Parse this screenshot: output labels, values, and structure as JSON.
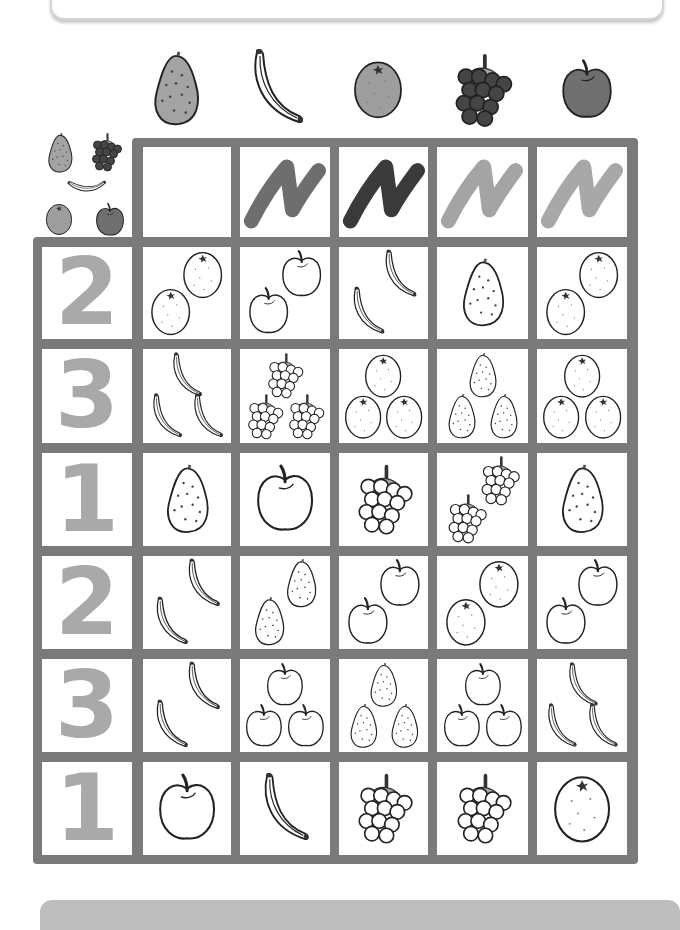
{
  "worksheet": {
    "header_fruits": [
      "pear",
      "banana",
      "orange",
      "grapes",
      "apple"
    ],
    "legend_fruits": [
      "pear",
      "grapes",
      "banana",
      "orange",
      "apple"
    ],
    "color_swatches": [
      {
        "label": "scribble",
        "color": "#6e6e6e"
      },
      {
        "label": "scribble",
        "color": "#3a3a3a"
      },
      {
        "label": "scribble",
        "color": "#a4a4a4"
      },
      {
        "label": "scribble",
        "color": "#a8a8a8"
      }
    ],
    "rows": [
      {
        "number": "2",
        "cells": [
          {
            "fruit": "orange",
            "count": 2
          },
          {
            "fruit": "apple",
            "count": 2
          },
          {
            "fruit": "banana",
            "count": 2
          },
          {
            "fruit": "pear",
            "count": 1
          },
          {
            "fruit": "orange",
            "count": 2
          }
        ]
      },
      {
        "number": "3",
        "cells": [
          {
            "fruit": "banana",
            "count": 3
          },
          {
            "fruit": "grapes",
            "count": 3
          },
          {
            "fruit": "orange",
            "count": 3
          },
          {
            "fruit": "pear",
            "count": 3
          },
          {
            "fruit": "orange",
            "count": 3
          }
        ]
      },
      {
        "number": "1",
        "cells": [
          {
            "fruit": "pear",
            "count": 1
          },
          {
            "fruit": "apple",
            "count": 1
          },
          {
            "fruit": "grapes",
            "count": 1
          },
          {
            "fruit": "grapes",
            "count": 2
          },
          {
            "fruit": "pear",
            "count": 1
          }
        ]
      },
      {
        "number": "2",
        "cells": [
          {
            "fruit": "banana",
            "count": 2
          },
          {
            "fruit": "pear",
            "count": 2
          },
          {
            "fruit": "apple",
            "count": 2
          },
          {
            "fruit": "orange",
            "count": 2
          },
          {
            "fruit": "apple",
            "count": 2
          }
        ]
      },
      {
        "number": "3",
        "cells": [
          {
            "fruit": "banana",
            "count": 2
          },
          {
            "fruit": "apple",
            "count": 3
          },
          {
            "fruit": "pear",
            "count": 3
          },
          {
            "fruit": "apple",
            "count": 3
          },
          {
            "fruit": "banana",
            "count": 3
          }
        ]
      },
      {
        "number": "1",
        "cells": [
          {
            "fruit": "apple",
            "count": 1
          },
          {
            "fruit": "banana",
            "count": 1
          },
          {
            "fruit": "grapes",
            "count": 1
          },
          {
            "fruit": "grapes",
            "count": 1
          },
          {
            "fruit": "orange",
            "count": 1
          }
        ]
      }
    ],
    "colors": {
      "grid": "#7a7a7a",
      "number": "#a9a9a9",
      "pear_fill": "#a3a3a3",
      "orange_fill": "#9e9e9e",
      "grapes_fill": "#454545",
      "apple_fill": "#6f6f6f"
    }
  }
}
